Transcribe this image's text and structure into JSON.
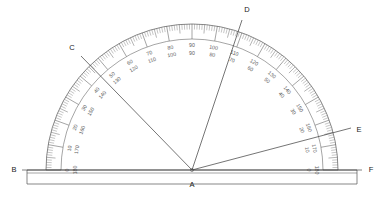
{
  "figure": {
    "kind": "protractor-diagram",
    "background_color": "#ffffff",
    "ink_color": "#4a4a4a",
    "label_color": "#1a1a1a",
    "scale_color": "#5a5a5a"
  },
  "geometry": {
    "center_x": 192,
    "center_y": 170,
    "outer_radius": 146,
    "inner_radius": 131,
    "tick_base_radius": 146,
    "baseline_y": 170,
    "baseline_left_x": 27,
    "baseline_right_x": 357,
    "base_bottom_y": 184,
    "base_left_x": 27,
    "base_right_x": 357
  },
  "points": [
    {
      "name": "B",
      "label": "B",
      "x": 14,
      "y": 170,
      "anchor": "middle"
    },
    {
      "name": "A",
      "label": "A",
      "x": 192,
      "y": 185,
      "anchor": "middle"
    },
    {
      "name": "F",
      "label": "F",
      "x": 371,
      "y": 170,
      "anchor": "middle"
    },
    {
      "name": "C",
      "label": "C",
      "x": 72,
      "y": 48,
      "anchor": "middle"
    },
    {
      "name": "D",
      "label": "D",
      "x": 247,
      "y": 10,
      "anchor": "middle"
    },
    {
      "name": "E",
      "label": "E",
      "x": 359,
      "y": 130,
      "anchor": "middle"
    }
  ],
  "rays": [
    {
      "name": "ray-AB",
      "from": "A",
      "to": "B",
      "angle_deg": 180,
      "endpoint_x": 27,
      "endpoint_y": 170
    },
    {
      "name": "ray-AF",
      "from": "A",
      "to": "F",
      "angle_deg": 0,
      "endpoint_x": 357,
      "endpoint_y": 170
    },
    {
      "name": "ray-AC",
      "from": "A",
      "to": "C",
      "angle_deg": 139,
      "endpoint_x": 81,
      "endpoint_y": 56
    },
    {
      "name": "ray-AD",
      "from": "A",
      "to": "D",
      "angle_deg": 70,
      "endpoint_x": 242,
      "endpoint_y": 20
    },
    {
      "name": "ray-AE",
      "from": "A",
      "to": "E",
      "angle_deg": 14,
      "endpoint_x": 351,
      "endpoint_y": 128
    }
  ],
  "scale": {
    "description": "Dual scale protractor, outer scale 0-180 counterclockwise from right, inner scale 0-180 clockwise from left",
    "tick_interval_deg": 1,
    "major_interval_deg": 10,
    "medium_interval_deg": 5,
    "range": [
      0,
      180
    ],
    "labels": [
      {
        "angle_deg": 0,
        "outer": "180",
        "inner": "0"
      },
      {
        "angle_deg": 10,
        "outer": "170",
        "inner": "10"
      },
      {
        "angle_deg": 20,
        "outer": "160",
        "inner": "20"
      },
      {
        "angle_deg": 30,
        "outer": "150",
        "inner": "30"
      },
      {
        "angle_deg": 40,
        "outer": "140",
        "inner": "40"
      },
      {
        "angle_deg": 50,
        "outer": "130",
        "inner": "50"
      },
      {
        "angle_deg": 60,
        "outer": "120",
        "inner": "60"
      },
      {
        "angle_deg": 70,
        "outer": "110",
        "inner": "70"
      },
      {
        "angle_deg": 80,
        "outer": "100",
        "inner": "80"
      },
      {
        "angle_deg": 90,
        "outer": "90",
        "inner": "90"
      },
      {
        "angle_deg": 100,
        "outer": "80",
        "inner": "100"
      },
      {
        "angle_deg": 110,
        "outer": "70",
        "inner": "110"
      },
      {
        "angle_deg": 120,
        "outer": "60",
        "inner": "120"
      },
      {
        "angle_deg": 130,
        "outer": "50",
        "inner": "130"
      },
      {
        "angle_deg": 140,
        "outer": "40",
        "inner": "140"
      },
      {
        "angle_deg": 150,
        "outer": "30",
        "inner": "150"
      },
      {
        "angle_deg": 160,
        "outer": "20",
        "inner": "160"
      },
      {
        "angle_deg": 170,
        "outer": "10",
        "inner": "170"
      },
      {
        "angle_deg": 180,
        "outer": "0",
        "inner": "180"
      }
    ]
  }
}
